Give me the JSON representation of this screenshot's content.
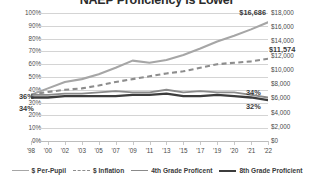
{
  "chart_data": {
    "type": "line",
    "title": "NAEP Proficiency is Lower",
    "xlabel": "",
    "ylabel": "",
    "y2label": "",
    "grid": true,
    "legend_position": "bottom",
    "x": [
      "'98",
      "'00",
      "'02",
      "'03",
      "'05",
      "'07",
      "'09",
      "'11",
      "'13",
      "'15",
      "'17",
      "'19",
      "'20",
      "'21",
      "'22"
    ],
    "categories": [
      "'98",
      "'00",
      "'02",
      "'03",
      "'05",
      "'07",
      "'09",
      "'11",
      "'13",
      "'15",
      "'17",
      "'19",
      "'20",
      "'21",
      "'22"
    ],
    "ylim": [
      0,
      100
    ],
    "yticks": [
      "0%",
      "10%",
      "20%",
      "30%",
      "40%",
      "50%",
      "60%",
      "70%",
      "80%",
      "90%",
      "100%"
    ],
    "y2lim": [
      0,
      18000
    ],
    "y2ticks": [
      "$0",
      "$2,000",
      "$4,000",
      "$6,000",
      "$8,000",
      "$10,000",
      "$12,000",
      "$14,000",
      "$16,000",
      "$18,000"
    ],
    "series": [
      {
        "name": "$ Per-Pupil",
        "axis": "y2",
        "style": "solid",
        "color": "#a6a6a6",
        "values": [
          6500,
          7400,
          8300,
          8700,
          9400,
          10300,
          11300,
          11000,
          11400,
          12100,
          13000,
          14000,
          14800,
          15700,
          16686
        ]
      },
      {
        "name": "$ Inflation",
        "axis": "y2",
        "style": "dashed",
        "color": "#8d8d8d",
        "values": [
          6500,
          6900,
          7200,
          7400,
          7800,
          8300,
          8700,
          9100,
          9500,
          9800,
          10300,
          10800,
          11000,
          11200,
          11574
        ]
      },
      {
        "name": "4th Grade Proficent",
        "axis": "y",
        "style": "solid",
        "color": "#8a8a8a",
        "values": [
          36,
          36,
          37,
          37,
          38,
          39,
          38,
          38,
          40,
          38,
          39,
          38,
          38,
          36,
          34
        ]
      },
      {
        "name": "8th Grade Proficient",
        "axis": "y",
        "style": "solid",
        "color": "#3c3c3c",
        "values": [
          34,
          34,
          35,
          35,
          35,
          35,
          36,
          36,
          37,
          35,
          35,
          36,
          35,
          34,
          32
        ]
      }
    ],
    "annotations": [
      {
        "text": "$16,686",
        "series": "$ Per-Pupil",
        "at": "'22"
      },
      {
        "text": "$11,574",
        "series": "$ Inflation",
        "at": "'22"
      },
      {
        "text": "36%",
        "series": "4th Grade Proficent",
        "at": "'98"
      },
      {
        "text": "34%",
        "series": "8th Grade Proficient",
        "at": "'98"
      },
      {
        "text": "34%",
        "series": "4th Grade Proficent",
        "at": "'22"
      },
      {
        "text": "32%",
        "series": "8th Grade Proficient",
        "at": "'22"
      }
    ]
  },
  "legend": {
    "items": [
      {
        "label": "$ Per-Pupil"
      },
      {
        "label": "$ Inflation"
      },
      {
        "label": "4th Grade Proficent"
      },
      {
        "label": "8th Grade Proficient"
      }
    ]
  },
  "annotation_labels": {
    "per_pupil_end": "$16,686",
    "inflation_end": "$11,574",
    "g4_start": "36%",
    "g8_start": "34%",
    "g4_end": "34%",
    "g8_end": "32%"
  },
  "axes": {
    "left_ticks": [
      "100%",
      "90%",
      "80%",
      "70%",
      "60%",
      "50%",
      "40%",
      "30%",
      "20%",
      "10%",
      "0%"
    ],
    "right_ticks": [
      "$18,000",
      "$16,000",
      "$14,000",
      "$12,000",
      "$10,000",
      "$8,000",
      "$6,000",
      "$4,000",
      "$2,000",
      "$0"
    ],
    "x_ticks": [
      "'98",
      "'00",
      "'02",
      "'03",
      "'05",
      "'07",
      "'09",
      "'11",
      "'13",
      "'15",
      "'17",
      "'19",
      "'20",
      "'21",
      "'22"
    ]
  }
}
